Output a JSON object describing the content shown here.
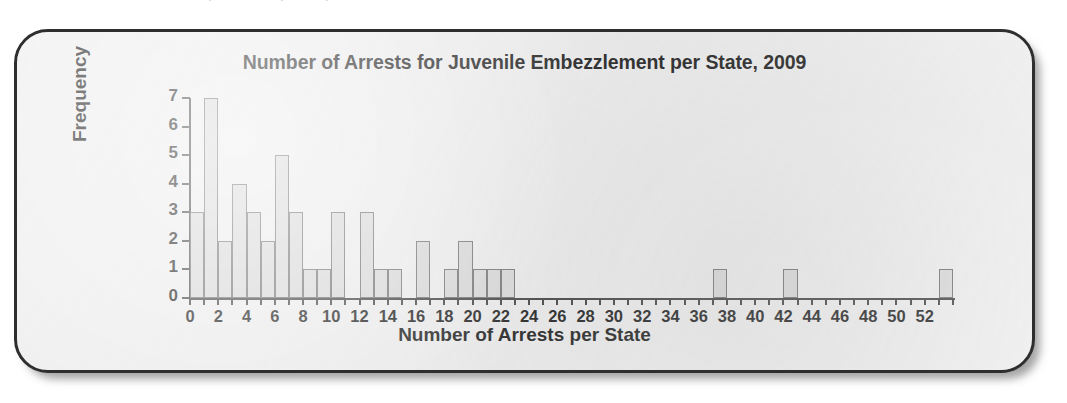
{
  "chart_data": {
    "type": "bar",
    "title": "Number of Arrests for Juvenile Embezzlement per State, 2009",
    "xlabel": "Number of Arrests per State",
    "ylabel": "Frequency",
    "xlim": [
      0,
      54
    ],
    "ylim": [
      0,
      7
    ],
    "bin_width": 1,
    "grid": false,
    "legend": null,
    "xticks": [
      0,
      2,
      4,
      6,
      8,
      10,
      12,
      14,
      16,
      18,
      20,
      22,
      24,
      26,
      28,
      30,
      32,
      34,
      36,
      38,
      40,
      42,
      44,
      46,
      48,
      50,
      52
    ],
    "xtick_labels": [
      "0",
      "2",
      "4",
      "6",
      "8",
      "10",
      "12",
      "14",
      "16",
      "18",
      "20",
      "22",
      "24",
      "26",
      "28",
      "30",
      "32",
      "34",
      "36",
      "38",
      "40",
      "42",
      "44",
      "46",
      "48",
      "50",
      "52"
    ],
    "yticks": [
      0,
      1,
      2,
      3,
      4,
      5,
      6,
      7
    ],
    "ytick_labels": [
      "0",
      "1",
      "2",
      "3",
      "4",
      "5",
      "6",
      "7"
    ],
    "bins": [
      {
        "start": 0,
        "end": 1,
        "value": 3
      },
      {
        "start": 1,
        "end": 2,
        "value": 7
      },
      {
        "start": 2,
        "end": 3,
        "value": 2
      },
      {
        "start": 3,
        "end": 4,
        "value": 4
      },
      {
        "start": 4,
        "end": 5,
        "value": 3
      },
      {
        "start": 5,
        "end": 6,
        "value": 2
      },
      {
        "start": 6,
        "end": 7,
        "value": 5
      },
      {
        "start": 7,
        "end": 8,
        "value": 3
      },
      {
        "start": 8,
        "end": 9,
        "value": 1
      },
      {
        "start": 9,
        "end": 10,
        "value": 1
      },
      {
        "start": 10,
        "end": 11,
        "value": 3
      },
      {
        "start": 11,
        "end": 12,
        "value": 0
      },
      {
        "start": 12,
        "end": 13,
        "value": 3
      },
      {
        "start": 13,
        "end": 14,
        "value": 1
      },
      {
        "start": 14,
        "end": 15,
        "value": 1
      },
      {
        "start": 15,
        "end": 16,
        "value": 0
      },
      {
        "start": 16,
        "end": 17,
        "value": 2
      },
      {
        "start": 17,
        "end": 18,
        "value": 0
      },
      {
        "start": 18,
        "end": 19,
        "value": 1
      },
      {
        "start": 19,
        "end": 20,
        "value": 2
      },
      {
        "start": 20,
        "end": 21,
        "value": 1
      },
      {
        "start": 21,
        "end": 22,
        "value": 1
      },
      {
        "start": 22,
        "end": 23,
        "value": 1
      },
      {
        "start": 37,
        "end": 38,
        "value": 1
      },
      {
        "start": 42,
        "end": 43,
        "value": 1
      },
      {
        "start": 53,
        "end": 54,
        "value": 1
      }
    ],
    "colors": {
      "bar_fill": "#d9d9d9",
      "bar_stroke": "#6d6d6d",
      "axis": "#3a3a3a",
      "text": "#161616",
      "card_background": "#eeeeee",
      "card_border": "#2e2e2e"
    }
  }
}
